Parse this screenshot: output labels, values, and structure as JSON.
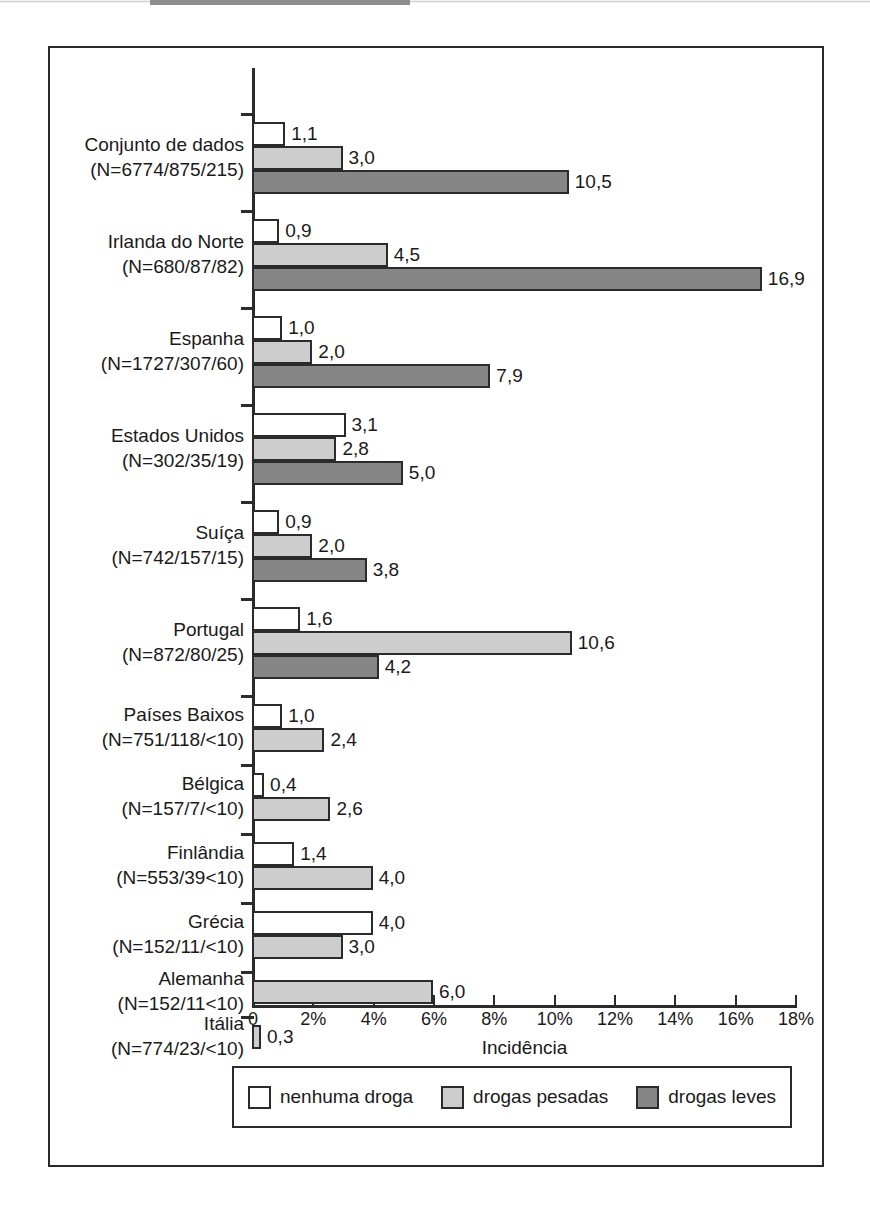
{
  "figure": {
    "x_axis_title": "Incidência",
    "legend_box_label": "legend"
  },
  "colors": {
    "series_no_drug": "#ffffff",
    "series_hard_drugs": "#cdcdcd",
    "series_light_drugs": "#868686",
    "outline": "#2b2b2b",
    "text": "#1a1a1a",
    "background": "#ffffff"
  },
  "chart_data": {
    "type": "bar",
    "orientation": "horizontal",
    "title": "",
    "subtitle": "",
    "xlabel": "Incidência",
    "ylabel": "",
    "xlim": [
      0,
      18
    ],
    "x_unit": "%",
    "grid": false,
    "legend_position": "bottom",
    "decimal_separator": ",",
    "tick_labels": [
      "0",
      "2%",
      "4%",
      "6%",
      "8%",
      "10%",
      "12%",
      "14%",
      "16%",
      "18%"
    ],
    "tick_values": [
      0,
      2,
      4,
      6,
      8,
      10,
      12,
      14,
      16,
      18
    ],
    "legend": [
      {
        "key": "no_drug",
        "label": "nenhuma droga",
        "color": "#ffffff"
      },
      {
        "key": "hard_drugs",
        "label": "drogas pesadas",
        "color": "#cdcdcd"
      },
      {
        "key": "light_drugs",
        "label": "drogas leves",
        "color": "#868686"
      }
    ],
    "series": [
      {
        "name": "nenhuma droga",
        "values": [
          1.1,
          0.9,
          1.0,
          3.1,
          0.9,
          1.6,
          1.0,
          0.4,
          1.4,
          4.0,
          null,
          null
        ]
      },
      {
        "name": "drogas pesadas",
        "values": [
          3.0,
          4.5,
          2.0,
          2.8,
          2.0,
          10.6,
          2.4,
          2.6,
          4.0,
          3.0,
          6.0,
          0.3
        ]
      },
      {
        "name": "drogas leves",
        "values": [
          10.5,
          16.9,
          7.9,
          5.0,
          3.8,
          4.2,
          null,
          null,
          null,
          null,
          null,
          null
        ]
      }
    ],
    "categories": [
      {
        "name": "Conjunto de dados",
        "n": "(N=6774/875/215)"
      },
      {
        "name": "Irlanda do Norte",
        "n": "(N=680/87/82)"
      },
      {
        "name": "Espanha",
        "n": "(N=1727/307/60)"
      },
      {
        "name": "Estados Unidos",
        "n": "(N=302/35/19)"
      },
      {
        "name": "Suíça",
        "n": "(N=742/157/15)"
      },
      {
        "name": "Portugal",
        "n": "(N=872/80/25)"
      },
      {
        "name": "Países Baixos",
        "n": "(N=751/118/<10)"
      },
      {
        "name": "Bélgica",
        "n": "(N=157/7/<10)"
      },
      {
        "name": "Finlândia",
        "n": "(N=553/39<10)"
      },
      {
        "name": "Grécia",
        "n": "(N=152/11/<10)"
      },
      {
        "name": "Alemanha",
        "n": "(N=152/11<10)"
      },
      {
        "name": "Itália",
        "n": "(N=774/23/<10)"
      }
    ],
    "data_labels": [
      {
        "category": "Conjunto de dados",
        "series": "nenhuma droga",
        "text": "1,1"
      },
      {
        "category": "Conjunto de dados",
        "series": "drogas pesadas",
        "text": "3,0"
      },
      {
        "category": "Conjunto de dados",
        "series": "drogas leves",
        "text": "10,5"
      },
      {
        "category": "Irlanda do Norte",
        "series": "nenhuma droga",
        "text": "0,9"
      },
      {
        "category": "Irlanda do Norte",
        "series": "drogas pesadas",
        "text": "4,5"
      },
      {
        "category": "Irlanda do Norte",
        "series": "drogas leves",
        "text": "16,9"
      },
      {
        "category": "Espanha",
        "series": "nenhuma droga",
        "text": "1,0"
      },
      {
        "category": "Espanha",
        "series": "drogas pesadas",
        "text": "2,0"
      },
      {
        "category": "Espanha",
        "series": "drogas leves",
        "text": "7,9"
      },
      {
        "category": "Estados Unidos",
        "series": "nenhuma droga",
        "text": "3,1"
      },
      {
        "category": "Estados Unidos",
        "series": "drogas pesadas",
        "text": "2,8"
      },
      {
        "category": "Estados Unidos",
        "series": "drogas leves",
        "text": "5,0"
      },
      {
        "category": "Suíça",
        "series": "nenhuma droga",
        "text": "0,9"
      },
      {
        "category": "Suíça",
        "series": "drogas pesadas",
        "text": "2,0"
      },
      {
        "category": "Suíça",
        "series": "drogas leves",
        "text": "3,8"
      },
      {
        "category": "Portugal",
        "series": "nenhuma droga",
        "text": "1,6"
      },
      {
        "category": "Portugal",
        "series": "drogas pesadas",
        "text": "10,6"
      },
      {
        "category": "Portugal",
        "series": "drogas leves",
        "text": "4,2"
      },
      {
        "category": "Países Baixos",
        "series": "nenhuma droga",
        "text": "1,0"
      },
      {
        "category": "Países Baixos",
        "series": "drogas pesadas",
        "text": "2,4"
      },
      {
        "category": "Bélgica",
        "series": "nenhuma droga",
        "text": "0,4"
      },
      {
        "category": "Bélgica",
        "series": "drogas pesadas",
        "text": "2,6"
      },
      {
        "category": "Finlândia",
        "series": "nenhuma droga",
        "text": "1,4"
      },
      {
        "category": "Finlândia",
        "series": "drogas pesadas",
        "text": "4,0"
      },
      {
        "category": "Grécia",
        "series": "nenhuma droga",
        "text": "4,0"
      },
      {
        "category": "Grécia",
        "series": "drogas pesadas",
        "text": "3,0"
      },
      {
        "category": "Alemanha",
        "series": "drogas pesadas",
        "text": "6,0"
      },
      {
        "category": "Itália",
        "series": "drogas pesadas",
        "text": "0,3"
      }
    ]
  }
}
